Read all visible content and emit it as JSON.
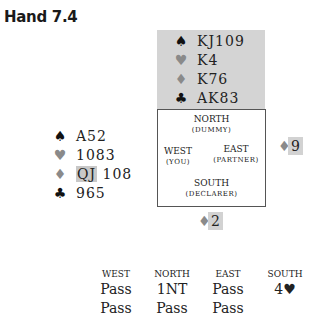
{
  "title": "Hand 7.4",
  "north": {
    "spades": "KJ109",
    "hearts": "K4",
    "diamonds": "K76",
    "clubs": "AK83"
  },
  "west": {
    "spades": "A52",
    "hearts": "1083",
    "diamonds_highlight": "QJ",
    "diamonds_rest": "108",
    "clubs": "965"
  },
  "compass": {
    "north": "NORTH",
    "north_role": "(DUMMY)",
    "west": "WEST",
    "west_role": "(YOU)",
    "east": "EAST",
    "east_role": "(PARTNER)",
    "south": "SOUTH",
    "south_role": "(DECLARER)"
  },
  "played": {
    "east": {
      "suit": "♦",
      "rank": "9"
    },
    "south": {
      "suit": "♦",
      "rank": "2"
    }
  },
  "suit_symbols": {
    "spades": "♠",
    "hearts": "♥",
    "diamonds": "♦",
    "clubs": "♣"
  },
  "colors": {
    "black_suit": "#111111",
    "red_suit_gray": "#8a8a8a",
    "dummy_bg": "#d4d4d4"
  },
  "auction": {
    "headers": [
      "WEST",
      "NORTH",
      "EAST",
      "SOUTH"
    ],
    "rows": [
      [
        "Pass",
        "1NT",
        "Pass",
        "4♥"
      ],
      [
        "Pass",
        "Pass",
        "Pass",
        ""
      ]
    ]
  }
}
